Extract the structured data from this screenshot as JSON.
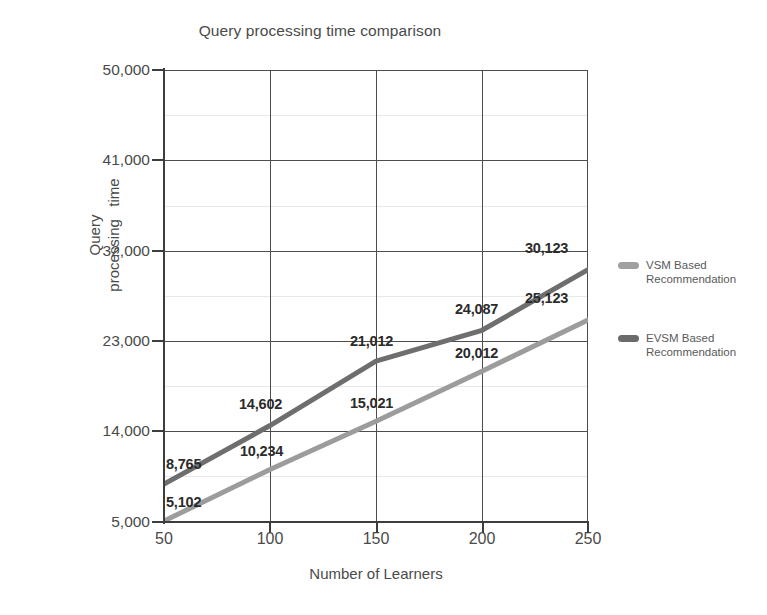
{
  "chart_data": {
    "type": "line",
    "title": "Query processing time comparison",
    "xlabel": "Number of Learners",
    "ylabel": "Query processing time",
    "ylabel_lines": [
      "Query",
      "processing",
      "time"
    ],
    "x": [
      50,
      100,
      150,
      200,
      250
    ],
    "xticklabels": [
      "50",
      "100",
      "150",
      "200",
      "250"
    ],
    "yticklabels": [
      "5,000",
      "14,000",
      "23,000",
      "32,000",
      "41,000",
      "50,000"
    ],
    "ytickvalues": [
      5000,
      14000,
      23000,
      32000,
      41000,
      50000
    ],
    "xlim": [
      50,
      250
    ],
    "ylim": [
      5000,
      50000
    ],
    "grid": true,
    "legend_position": "right",
    "series": [
      {
        "name": "VSM Based Recommendation",
        "color": "#9c9c9c",
        "values": [
          5102,
          10234,
          15021,
          20012,
          25123
        ],
        "labels": [
          "5,102",
          "10,234",
          "15,021",
          "20,012",
          "25,123"
        ]
      },
      {
        "name": "EVSM Based Recommendation",
        "color": "#6e6e6e",
        "values": [
          8765,
          14602,
          21012,
          24087,
          30123
        ],
        "labels": [
          "8,765",
          "14,602",
          "21,012",
          "24,087",
          "30,123"
        ]
      }
    ],
    "data_labels": [
      {
        "text": "8,765",
        "x": 166,
        "y": 456
      },
      {
        "text": "5,102",
        "x": 166,
        "y": 494
      },
      {
        "text": "10,234",
        "x": 240,
        "y": 443
      },
      {
        "text": "14,602",
        "x": 239,
        "y": 396
      },
      {
        "text": "15,021",
        "x": 350,
        "y": 395
      },
      {
        "text": "21,012",
        "x": 350,
        "y": 333
      },
      {
        "text": "20,012",
        "x": 455,
        "y": 345
      },
      {
        "text": "24,087",
        "x": 455,
        "y": 301
      },
      {
        "text": "25,123",
        "x": 525,
        "y": 290
      },
      {
        "text": "30,123",
        "x": 525,
        "y": 240
      }
    ],
    "legend": [
      {
        "label_line1": "VSM Based",
        "label_line2": "Recommendation",
        "color": "#a0a0a0"
      },
      {
        "label_line1": "EVSM Based",
        "label_line2": "Recommendation",
        "color": "#6b6b6b"
      }
    ]
  },
  "colors": {
    "background": "#ffffff",
    "axis": "#3d3d3d",
    "grid_major": "#4d4d4d",
    "grid_minor": "#e8e8e8",
    "text": "#4a4a4a",
    "label_text": "#2b2b2b"
  }
}
